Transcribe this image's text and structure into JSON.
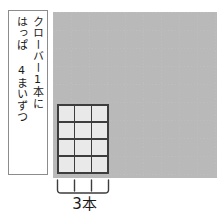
{
  "worksheet": {
    "caption": {
      "line_right": "クローバー1本に",
      "line_left": "はっぱ 4まいずつ"
    },
    "grid": {
      "columns": 9,
      "rows": 9,
      "cell_size_px": 18,
      "line_color": "#b8b8b8",
      "line_style": "dotted"
    },
    "array_block": {
      "columns": 3,
      "rows": 4,
      "cell_count": 12,
      "fill_color": "#e9e9e9",
      "border_color": "#3d3d3d"
    },
    "bracket": {
      "label": "3本",
      "tick_count": 2,
      "spans_columns": 3,
      "color": "#3d3d3d"
    }
  }
}
